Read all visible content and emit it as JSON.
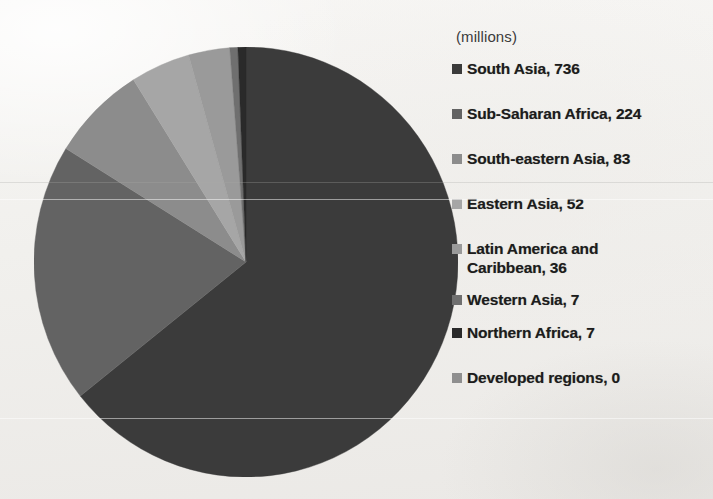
{
  "legend": {
    "units_label": "(millions)",
    "entries": [
      {
        "label": "South Asia, 736",
        "name": "South Asia",
        "value": 736,
        "color": "#3b3b3b",
        "swatch": "#3b3b3b"
      },
      {
        "label": "Sub-Saharan Africa, 224",
        "name": "Sub-Saharan Africa",
        "value": 224,
        "color": "#636363",
        "swatch": "#636363"
      },
      {
        "label": "South-eastern Asia, 83",
        "name": "South-eastern Asia",
        "value": 83,
        "color": "#8c8c8c",
        "swatch": "#8c8c8c"
      },
      {
        "label": "Eastern Asia, 52",
        "name": "Eastern Asia",
        "value": 52,
        "color": "#a6a6a6",
        "swatch": "#a6a6a6"
      },
      {
        "label": "Latin America and\nCaribbean, 36",
        "name": "Latin America and Caribbean",
        "value": 36,
        "color": "#9a9a9a",
        "swatch": "#9a9a9a"
      },
      {
        "label": "Western Asia, 7",
        "name": "Western Asia",
        "value": 7,
        "color": "#6f6f6f",
        "swatch": "#6f6f6f"
      },
      {
        "label": "Northern Africa, 7",
        "name": "Northern Africa",
        "value": 7,
        "color": "#2a2a2a",
        "swatch": "#2a2a2a"
      },
      {
        "label": "Developed regions, 0",
        "name": "Developed regions",
        "value": 0,
        "color": "#8f8f8f",
        "swatch": "#8f8f8f"
      }
    ]
  },
  "chart_data": {
    "type": "pie",
    "title": "",
    "units": "millions",
    "total": 1145,
    "legend_position": "right",
    "labels": [
      "South Asia",
      "Sub-Saharan Africa",
      "South-eastern Asia",
      "Eastern Asia",
      "Latin America and Caribbean",
      "Western Asia",
      "Northern Africa",
      "Developed regions"
    ],
    "values": [
      736,
      224,
      83,
      52,
      36,
      7,
      7,
      0
    ],
    "colors": [
      "#3b3b3b",
      "#636363",
      "#8c8c8c",
      "#a6a6a6",
      "#9a9a9a",
      "#6f6f6f",
      "#2a2a2a",
      "#8f8f8f"
    ],
    "start_angle_deg": 0,
    "direction": "clockwise"
  }
}
